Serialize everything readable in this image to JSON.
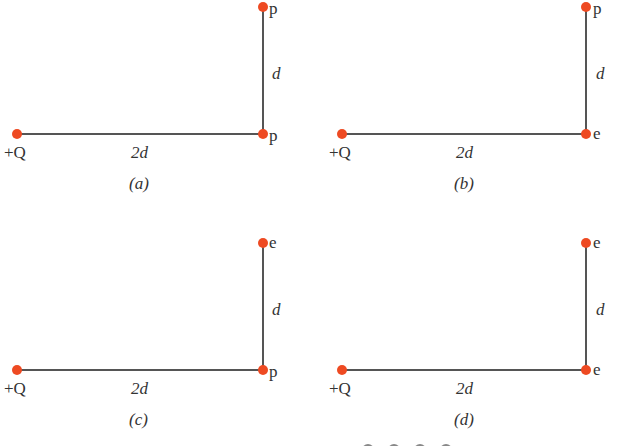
{
  "figure": {
    "panels": [
      {
        "id": "a",
        "caption": "(a)",
        "charge_label": "+Q",
        "horizontal_label": "2d",
        "vertical_label": "d",
        "corner_particle": "p",
        "top_particle": "p"
      },
      {
        "id": "b",
        "caption": "(b)",
        "charge_label": "+Q",
        "horizontal_label": "2d",
        "vertical_label": "d",
        "corner_particle": "e",
        "top_particle": "p"
      },
      {
        "id": "c",
        "caption": "(c)",
        "charge_label": "+Q",
        "horizontal_label": "2d",
        "vertical_label": "d",
        "corner_particle": "p",
        "top_particle": "e"
      },
      {
        "id": "d",
        "caption": "(d)",
        "charge_label": "+Q",
        "horizontal_label": "2d",
        "vertical_label": "d",
        "corner_particle": "e",
        "top_particle": "e"
      }
    ],
    "colors": {
      "dot": "#ee4a22",
      "line": "#555555",
      "text": "#333333"
    }
  }
}
